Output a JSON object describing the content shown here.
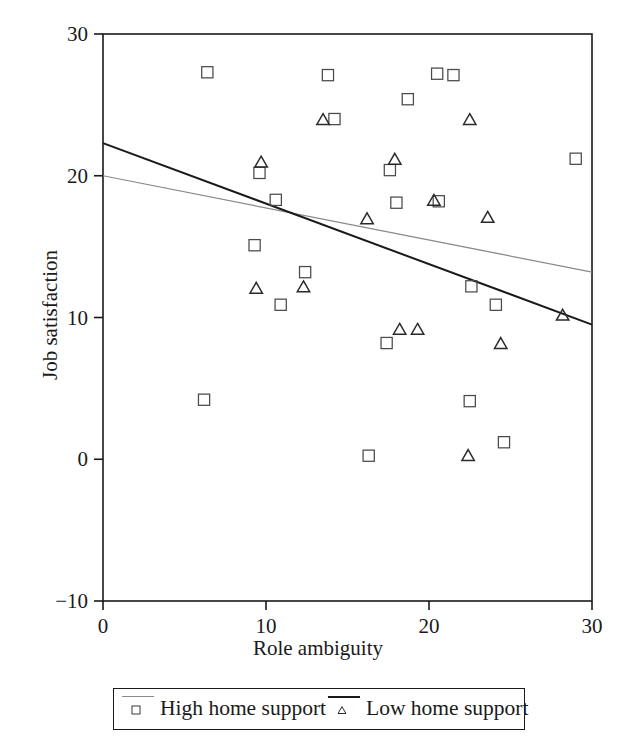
{
  "chart_data": {
    "type": "scatter",
    "title": "",
    "xlabel": "Role ambiguity",
    "ylabel": "Job satisfaction",
    "xlim": [
      0,
      30
    ],
    "ylim": [
      -10,
      30
    ],
    "xticks": [
      0,
      10,
      20,
      30
    ],
    "yticks": [
      -10,
      0,
      10,
      20,
      30
    ],
    "xtick_labels": [
      "0",
      "10",
      "20",
      "30"
    ],
    "ytick_labels": [
      "−10",
      "0",
      "10",
      "20",
      "30"
    ],
    "grid": false,
    "legend_position": "below-axes",
    "frame": true,
    "series": [
      {
        "name": "High home support",
        "marker": "square",
        "marker_color": "#4a4a4a",
        "line_color": "#8a8a8a",
        "line_width": 1.2,
        "trendline": {
          "x": [
            0,
            30
          ],
          "y": [
            20.0,
            13.2
          ]
        },
        "points": [
          [
            6.4,
            27.3
          ],
          [
            6.2,
            4.2
          ],
          [
            9.3,
            15.1
          ],
          [
            9.6,
            20.2
          ],
          [
            10.6,
            18.3
          ],
          [
            10.9,
            10.9
          ],
          [
            12.4,
            13.2
          ],
          [
            13.8,
            27.1
          ],
          [
            14.2,
            24.0
          ],
          [
            16.3,
            0.25
          ],
          [
            17.4,
            8.2
          ],
          [
            17.6,
            20.4
          ],
          [
            18.0,
            18.1
          ],
          [
            18.7,
            25.4
          ],
          [
            20.5,
            27.2
          ],
          [
            20.6,
            18.2
          ],
          [
            21.5,
            27.1
          ],
          [
            22.6,
            12.2
          ],
          [
            22.5,
            4.1
          ],
          [
            24.1,
            10.9
          ],
          [
            24.6,
            1.2
          ],
          [
            29.0,
            21.2
          ]
        ]
      },
      {
        "name": "Low home support",
        "marker": "triangle",
        "marker_color": "#2a2a2a",
        "line_color": "#1a1a1a",
        "line_width": 2.0,
        "trendline": {
          "x": [
            0,
            30
          ],
          "y": [
            22.3,
            9.5
          ]
        },
        "points": [
          [
            9.4,
            12.1
          ],
          [
            9.7,
            21.0
          ],
          [
            12.3,
            12.2
          ],
          [
            13.5,
            24.0
          ],
          [
            16.2,
            17.0
          ],
          [
            17.9,
            21.2
          ],
          [
            18.2,
            9.2
          ],
          [
            19.3,
            9.2
          ],
          [
            20.3,
            18.3
          ],
          [
            22.5,
            24.0
          ],
          [
            22.4,
            0.3
          ],
          [
            23.6,
            17.1
          ],
          [
            24.4,
            8.2
          ],
          [
            28.2,
            10.2
          ]
        ]
      }
    ]
  },
  "axes": {
    "x_title": "Role ambiguity",
    "y_title": "Job satisfaction",
    "x_tick_labels": [
      "0",
      "10",
      "20",
      "30"
    ],
    "y_tick_labels": [
      "30",
      "20",
      "10",
      "0",
      "−10"
    ]
  },
  "legend": {
    "entries": [
      {
        "label": "High home support",
        "marker": "square-marker",
        "line_color": "#8a8a8a"
      },
      {
        "label": "Low home support",
        "marker": "triangle-marker",
        "line_color": "#1a1a1a"
      }
    ]
  }
}
